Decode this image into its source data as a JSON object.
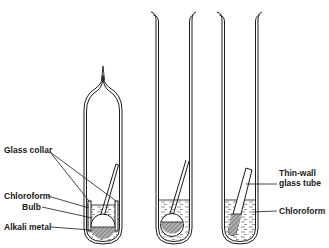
{
  "diagram": {
    "title": "",
    "labels": {
      "glass_collar": "Glass collar",
      "chloroform_left": "Chloroform",
      "bulb": "Bulb",
      "alkali_metal": "Alkali metal",
      "thin_wall_line1": "Thin-wall",
      "thin_wall_line2": "glass tube",
      "chloroform_right": "Chloroform"
    },
    "colors": {
      "ink": "#1a1a1a",
      "metal_fill": "#9a9a9a",
      "liquid_dash": "#555555"
    }
  }
}
